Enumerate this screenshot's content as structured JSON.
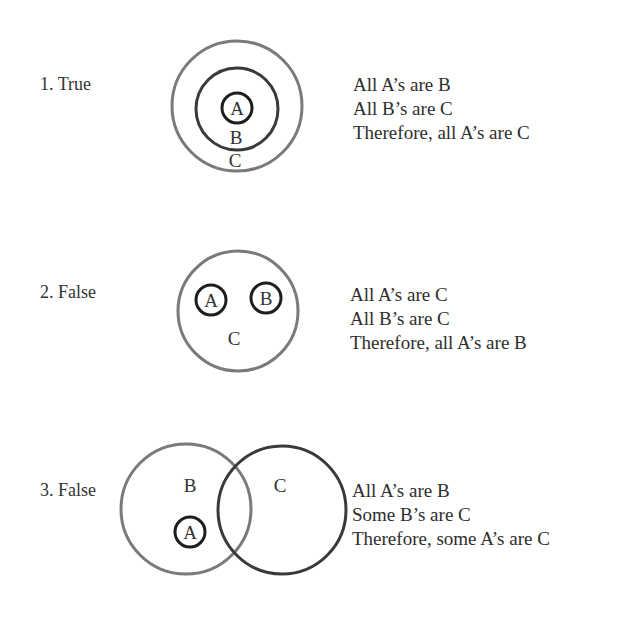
{
  "syllogisms": [
    {
      "label": "1. True",
      "statements": [
        "All A’s are B",
        "All B’s are C",
        "Therefore, all A’s are C"
      ],
      "circles": [
        {
          "name": "C",
          "cx": 237,
          "cy": 106,
          "r": 65,
          "stroke": "#7a7a7a",
          "width": 3
        },
        {
          "name": "B",
          "cx": 237,
          "cy": 109,
          "r": 41,
          "stroke": "#3a3a3a",
          "width": 3
        },
        {
          "name": "A",
          "cx": 237,
          "cy": 108,
          "r": 15,
          "stroke": "#1e1e1e",
          "width": 3
        }
      ],
      "circle_labels": {
        "A": "A",
        "B": "B",
        "C": "C"
      }
    },
    {
      "label": "2. False",
      "statements": [
        "All A’s are C",
        "All B’s are C",
        "Therefore, all A’s are B"
      ],
      "circles": [
        {
          "name": "C",
          "cx": 238,
          "cy": 311,
          "r": 60,
          "stroke": "#7a7a7a",
          "width": 3
        },
        {
          "name": "A",
          "cx": 211,
          "cy": 300,
          "r": 15,
          "stroke": "#1e1e1e",
          "width": 3
        },
        {
          "name": "B",
          "cx": 266,
          "cy": 298,
          "r": 15,
          "stroke": "#1e1e1e",
          "width": 3
        }
      ],
      "circle_labels": {
        "A": "A",
        "B": "B",
        "C": "C"
      }
    },
    {
      "label": "3. False",
      "statements": [
        "All A’s are B",
        "Some B’s are C",
        "Therefore, some A’s are C"
      ],
      "circles": [
        {
          "name": "B",
          "cx": 186,
          "cy": 509,
          "r": 65,
          "stroke": "#7a7a7a",
          "width": 3
        },
        {
          "name": "C",
          "cx": 282,
          "cy": 510,
          "r": 64,
          "stroke": "#3a3a3a",
          "width": 3
        },
        {
          "name": "A",
          "cx": 190,
          "cy": 532,
          "r": 15,
          "stroke": "#1e1e1e",
          "width": 3
        }
      ],
      "circle_labels": {
        "A": "A",
        "B": "B",
        "C": "C"
      }
    }
  ]
}
